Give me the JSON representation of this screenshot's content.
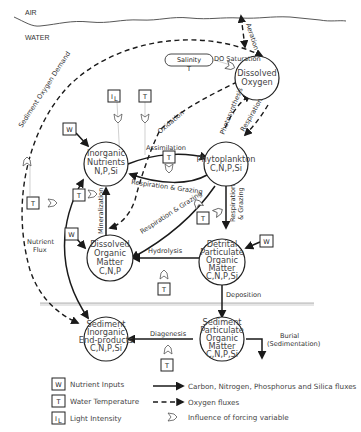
{
  "layers": {
    "air": "AIR",
    "water": "WATER"
  },
  "nodes": {
    "dissolved_oxygen": [
      "Dissolved",
      "Oxygen"
    ],
    "inorganic_nutrients": [
      "Inorganic",
      "Nutrients",
      "N,P,Si"
    ],
    "phytoplankton": [
      "Phytoplankton",
      "C,N,P,Si"
    ],
    "dissolved_organic_matter": [
      "Dissolved",
      "Organic",
      "Matter",
      "C,N,P"
    ],
    "detrital_pom": [
      "Detrital",
      "Particulate",
      "Organic",
      "Matter",
      "C,N,P,Si"
    ],
    "sediment_inorganic": [
      "Sediment",
      "Inorganic",
      "End-products",
      "C,N,P,Si"
    ],
    "sediment_pom": [
      "Sediment",
      "Particulate",
      "Organic",
      "Matter",
      "C,N,P,Si"
    ]
  },
  "salinity": {
    "label": "Salinity",
    "sub": "T"
  },
  "fluxes": {
    "aeration": "Aeration",
    "do_saturation": "DO Saturation",
    "sediment_oxygen_demand": "Sediment Oxygen Demand",
    "oxidation": "Oxidation",
    "assimilation": "Assimilation",
    "photosynthesis": "Photosynthesis",
    "respiration": "Respiration",
    "resp_grazing_1": "Respiration & Grazing",
    "resp_grazing_2": "Respiration & Grazing",
    "resp_grazing_3a": "Respiration",
    "resp_grazing_3b": "& Grazing",
    "mineralization": "Mineralization",
    "hydrolysis": "Hydrolysis",
    "nutrient_flux_a": "Nutrient",
    "nutrient_flux_b": "Flux",
    "deposition": "Deposition",
    "diagenesis": "Diagenesis",
    "burial_a": "Burial",
    "burial_b": "(Sedimentation)"
  },
  "forcing": {
    "W": "W",
    "T": "T",
    "IL": "I",
    "IL_sub": "L"
  },
  "legend": {
    "items_left": [
      {
        "symbol": "W",
        "label": "Nutrient Inputs"
      },
      {
        "symbol": "T",
        "label": "Water Temperature"
      },
      {
        "symbol": "I",
        "sub": "L",
        "label": "Light Intensity"
      }
    ],
    "items_right": [
      {
        "type": "solid-arrow",
        "label": "Carbon, Nitrogen, Phosphorus and Silica fluxes"
      },
      {
        "type": "dashed-arrow",
        "label": "Oxygen fluxes"
      },
      {
        "type": "forcing-symbol",
        "label": "Influence of forcing variable"
      }
    ]
  }
}
